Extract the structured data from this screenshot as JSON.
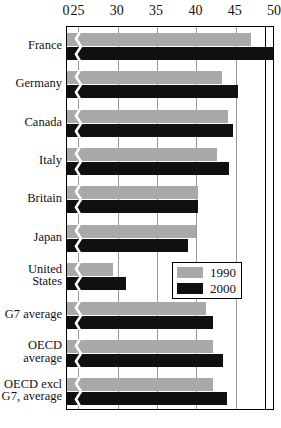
{
  "chart_data": {
    "type": "bar",
    "orientation": "horizontal",
    "title": "",
    "subtitle": "",
    "xlabel": "",
    "ylabel": "",
    "grid": true,
    "axis_break": true,
    "axis_break_note": "x-axis is broken between 0 and 25",
    "xlim": [
      0,
      50
    ],
    "xticks": [
      0,
      25,
      30,
      35,
      40,
      45,
      50
    ],
    "xtick_labels": [
      "0",
      "25",
      "30",
      "35",
      "40",
      "45",
      "50"
    ],
    "legend_position": "middle-right",
    "categories": [
      "France",
      "Germany",
      "Canada",
      "Italy",
      "Britain",
      "Japan",
      "United States",
      "G7 average",
      "OECD average",
      "OECD excl G7, average"
    ],
    "category_lines": [
      [
        "France"
      ],
      [
        "Germany"
      ],
      [
        "Canada"
      ],
      [
        "Italy"
      ],
      [
        "Britain"
      ],
      [
        "Japan"
      ],
      [
        "United",
        "States"
      ],
      [
        "G7 average"
      ],
      [
        "OECD",
        "average"
      ],
      [
        "OECD excl",
        "G7, average"
      ]
    ],
    "series": [
      {
        "name": "1990",
        "color": "#a9a9a9",
        "values": [
          47.0,
          43.2,
          44.0,
          42.6,
          40.2,
          39.9,
          29.4,
          41.2,
          42.1,
          42.1
        ]
      },
      {
        "name": "2000",
        "color": "#101010",
        "values": [
          49.9,
          45.3,
          44.6,
          44.1,
          40.2,
          38.9,
          31.0,
          42.1,
          43.4,
          43.9
        ]
      }
    ]
  },
  "legend": {
    "items": [
      {
        "label": "1990",
        "swatch": "gray-swatch"
      },
      {
        "label": "2000",
        "swatch": "black-swatch"
      }
    ]
  },
  "colors": {
    "series_1990": "#a9a9a9",
    "series_2000": "#101010",
    "gridline": "#9a9a9a",
    "frame": "#000000",
    "background": "#ffffff"
  }
}
